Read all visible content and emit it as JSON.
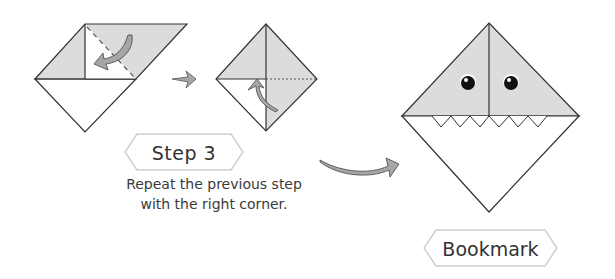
{
  "step": {
    "label": "Step 3",
    "instruction_line1": "Repeat the previous step",
    "instruction_line2": "with the right corner."
  },
  "result": {
    "label": "Bookmark"
  },
  "colors": {
    "paper_fill": "#dcdcdc",
    "line": "#333333",
    "label_border": "#cccccc",
    "arrow_fill": "#a6a6a6"
  },
  "diagrams": [
    {
      "name": "fold-right-corner-start",
      "description": "Right corner folded down along dashed line"
    },
    {
      "name": "fold-right-corner-done",
      "description": "Both corners folded, dotted line on right"
    },
    {
      "name": "finished-shark-bookmark",
      "description": "Shark face with eyes and teeth"
    }
  ]
}
